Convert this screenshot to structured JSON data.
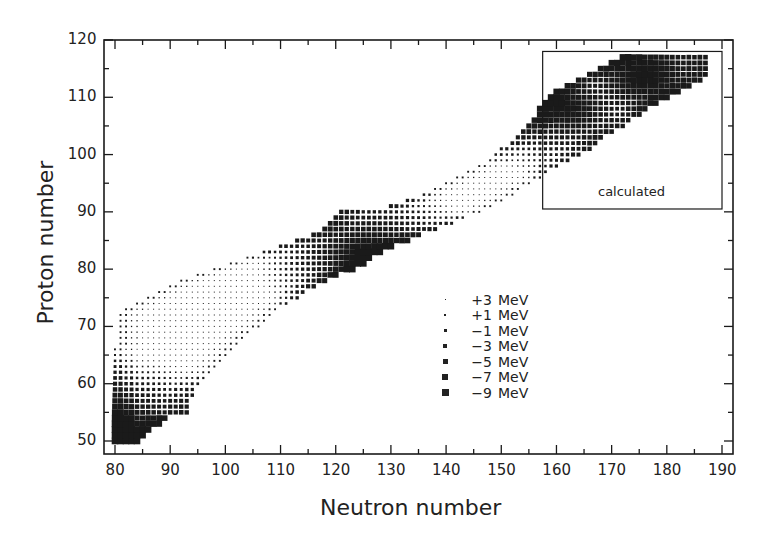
{
  "chart_data": {
    "type": "heatmap",
    "title": "",
    "xlabel": "Neutron number",
    "ylabel": "Proton number",
    "xlim": [
      79,
      192
    ],
    "ylim": [
      48,
      120
    ],
    "xticks": [
      80,
      90,
      100,
      110,
      120,
      130,
      140,
      150,
      160,
      170,
      180,
      190
    ],
    "yticks": [
      50,
      60,
      70,
      80,
      90,
      100,
      110,
      120
    ],
    "grid": false,
    "annotation": {
      "text": "calculated",
      "box": {
        "n_min": 157.5,
        "n_max": 190,
        "z_min": 90.5,
        "z_max": 118
      }
    },
    "legend": {
      "position": "inside lower right",
      "entries": [
        {
          "label": "+3 MeV",
          "value": 3,
          "size": 1
        },
        {
          "label": "+1 MeV",
          "value": 1,
          "size": 2
        },
        {
          "label": "−1 MeV",
          "value": -1,
          "size": 3
        },
        {
          "label": "−3 MeV",
          "value": -3,
          "size": 4
        },
        {
          "label": "−5 MeV",
          "value": -5,
          "size": 5
        },
        {
          "label": "−7 MeV",
          "value": -7,
          "size": 6
        },
        {
          "label": "−9 MeV",
          "value": -9,
          "size": 7
        }
      ]
    },
    "rows_description": "each row: [Z, N_min, N_max] of nuclei shown; marker size encodes shell-correction energy",
    "rows": [
      [
        50,
        80,
        84
      ],
      [
        51,
        80,
        85
      ],
      [
        52,
        80,
        86
      ],
      [
        53,
        80,
        88
      ],
      [
        54,
        80,
        89
      ],
      [
        55,
        80,
        93
      ],
      [
        56,
        80,
        93
      ],
      [
        57,
        80,
        93
      ],
      [
        58,
        80,
        94
      ],
      [
        59,
        80,
        94
      ],
      [
        60,
        80,
        95
      ],
      [
        61,
        80,
        96
      ],
      [
        62,
        80,
        97
      ],
      [
        63,
        80,
        98
      ],
      [
        64,
        80,
        99
      ],
      [
        65,
        80,
        100
      ],
      [
        66,
        80,
        101
      ],
      [
        67,
        81,
        102
      ],
      [
        68,
        81,
        103
      ],
      [
        69,
        81,
        104
      ],
      [
        70,
        81,
        106
      ],
      [
        71,
        81,
        107
      ],
      [
        72,
        81,
        108
      ],
      [
        73,
        82,
        109
      ],
      [
        74,
        84,
        111
      ],
      [
        75,
        86,
        113
      ],
      [
        76,
        88,
        114
      ],
      [
        77,
        90,
        116
      ],
      [
        78,
        92,
        118
      ],
      [
        79,
        95,
        120
      ],
      [
        80,
        98,
        123
      ],
      [
        81,
        101,
        125
      ],
      [
        82,
        104,
        126
      ],
      [
        83,
        107,
        128
      ],
      [
        84,
        110,
        130
      ],
      [
        85,
        113,
        133
      ],
      [
        86,
        116,
        135
      ],
      [
        87,
        118,
        138
      ],
      [
        88,
        119,
        141
      ],
      [
        89,
        120,
        143
      ],
      [
        90,
        121,
        146
      ],
      [
        91,
        130,
        148
      ],
      [
        92,
        133,
        150
      ],
      [
        93,
        136,
        152
      ],
      [
        94,
        138,
        153
      ],
      [
        95,
        140,
        155
      ],
      [
        96,
        142,
        157
      ],
      [
        97,
        144,
        158
      ],
      [
        98,
        146,
        160
      ],
      [
        99,
        148,
        162
      ],
      [
        100,
        149,
        164
      ],
      [
        101,
        150,
        166
      ],
      [
        102,
        152,
        167
      ],
      [
        103,
        153,
        168
      ],
      [
        104,
        154,
        170
      ],
      [
        105,
        155,
        172
      ],
      [
        106,
        156,
        173
      ],
      [
        107,
        157,
        175
      ],
      [
        108,
        157,
        176
      ],
      [
        109,
        158,
        178
      ],
      [
        110,
        159,
        180
      ],
      [
        111,
        160,
        182
      ],
      [
        112,
        162,
        184
      ],
      [
        113,
        164,
        186
      ],
      [
        114,
        166,
        187
      ],
      [
        115,
        168,
        187
      ],
      [
        116,
        170,
        187
      ],
      [
        117,
        172,
        187
      ]
    ],
    "shell_minima": [
      {
        "z": 51,
        "n": 82,
        "depth": -9
      },
      {
        "z": 82,
        "n": 126,
        "depth": -9
      },
      {
        "z": 114,
        "n": 176,
        "depth": -9
      },
      {
        "z": 108,
        "n": 162,
        "depth": -8
      }
    ]
  },
  "axes": {
    "xlabel": "Neutron number",
    "ylabel": "Proton number",
    "xtick_labels": [
      "80",
      "90",
      "100",
      "110",
      "120",
      "130",
      "140",
      "150",
      "160",
      "170",
      "180",
      "190"
    ],
    "ytick_labels": [
      "50",
      "60",
      "70",
      "80",
      "90",
      "100",
      "110",
      "120"
    ]
  },
  "annotation": {
    "calculated": "calculated"
  },
  "legend": {
    "labels": [
      "+3",
      "+1",
      "−1",
      "−3",
      "−5",
      "−7",
      "−9"
    ],
    "unit": "MeV"
  },
  "colors": {
    "ink": "#1a1a1a",
    "background": "#ffffff"
  }
}
